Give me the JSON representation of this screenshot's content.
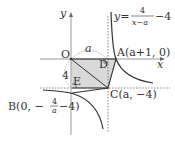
{
  "diagram": {
    "curve_equation": {
      "lhs": "y",
      "eq": "=",
      "num": "4",
      "den": "x−a",
      "tail": "−4"
    },
    "axes": {
      "x_label": "x",
      "y_label": "y"
    },
    "points": {
      "O": {
        "label": "O"
      },
      "A": {
        "label": "A",
        "coords": "(a+1, 0)"
      },
      "B": {
        "label": "B",
        "coords_pre": "(0, −",
        "frac_num": "4",
        "frac_den": "a",
        "coords_post": "−4)"
      },
      "C": {
        "label": "C",
        "coords": "(a, −4)"
      },
      "D": {
        "label": "D"
      },
      "E": {
        "label": "E"
      }
    },
    "segment_labels": {
      "top": "a",
      "left": "4"
    },
    "colors": {
      "shade": "#d9d9d9",
      "line": "#333333",
      "axis": "#9a9a9a",
      "curve": "#333333"
    }
  }
}
